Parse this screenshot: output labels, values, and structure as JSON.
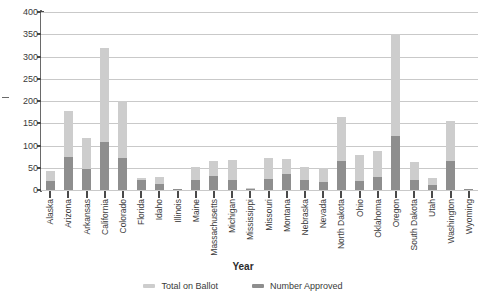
{
  "chart_data": {
    "type": "bar",
    "title": "",
    "xlabel": "Year",
    "ylabel": "",
    "ylim": [
      0,
      400
    ],
    "ytick_step": 50,
    "yticks": [
      400,
      350,
      300,
      250,
      200,
      150,
      100,
      50,
      0
    ],
    "grid": true,
    "stacked_overlay": true,
    "legend_position": "bottom-center",
    "categories": [
      "Alaska",
      "Arizona",
      "Arkansas",
      "California",
      "Colorado",
      "Florida",
      "Idaho",
      "Illinois",
      "Maine",
      "Massachusetts",
      "Michigan",
      "Mississippi",
      "Missouri",
      "Montana",
      "Nebraska",
      "Nevada",
      "North Dakota",
      "Ohio",
      "Oklahoma",
      "Oregon",
      "South Dakota",
      "Utah",
      "Washington",
      "Wyoming"
    ],
    "series": [
      {
        "name": "Total on Ballot",
        "color": "#cdcdcd",
        "values": [
          42,
          178,
          118,
          320,
          200,
          28,
          30,
          3,
          52,
          66,
          68,
          4,
          72,
          70,
          52,
          50,
          165,
          78,
          88,
          350,
          62,
          27,
          155,
          2
        ]
      },
      {
        "name": "Number Approved",
        "color": "#8e8e8e",
        "values": [
          21,
          75,
          48,
          108,
          71,
          22,
          14,
          1,
          22,
          31,
          23,
          1,
          24,
          36,
          22,
          19,
          65,
          20,
          29,
          122,
          22,
          12,
          65,
          1
        ]
      }
    ]
  },
  "legend": {
    "items": [
      {
        "label": "Total on Ballot",
        "color": "#cdcdcd"
      },
      {
        "label": "Number Approved",
        "color": "#8e8e8e"
      }
    ]
  },
  "axis": {
    "x_title": "Year"
  }
}
